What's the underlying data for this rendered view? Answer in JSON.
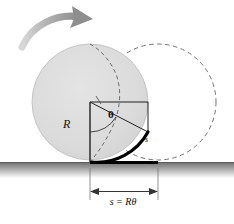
{
  "figure": {
    "name": "rolling-wheel-arc-length-diagram",
    "labels": {
      "radius": "R",
      "angle": "θ",
      "arc": "s",
      "dimension": "s = Rθ"
    },
    "icons": {
      "rotation_arrow": "curved-rotation-arrow-icon",
      "dimension_arrow_left": "arrow-left-icon",
      "dimension_arrow_right": "arrow-right-icon"
    },
    "colors": {
      "wheel_fill": "#dcdcdc",
      "wheel_stroke": "#b4b4b4",
      "dashed_stroke": "#555555",
      "thick_black": "#000000",
      "ground_dark": "#6e6e6e",
      "rotation_arrow": "#9a9a9a",
      "line": "#222222"
    },
    "geometry": {
      "wheel_center_x": 90,
      "wheel_center_y": 102,
      "wheel_radius": 58,
      "rolled_center_x": 158,
      "ground_y": 162,
      "contact_start_x": 90,
      "contact_end_x": 158
    }
  }
}
